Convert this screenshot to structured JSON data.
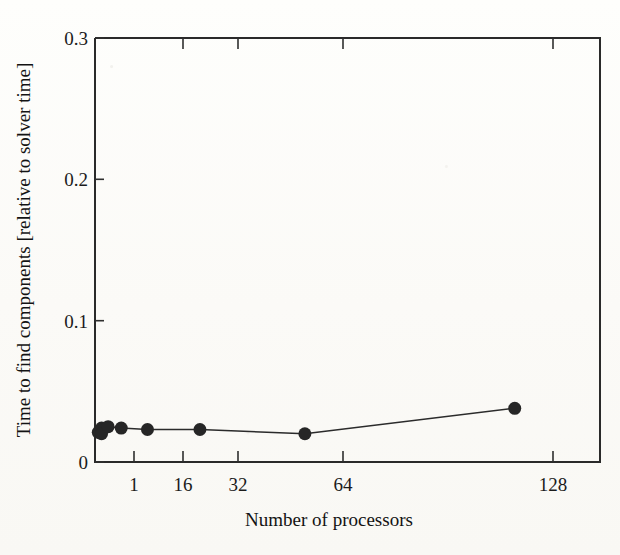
{
  "chart_data": {
    "type": "line",
    "title": "",
    "xlabel": "Number of processors",
    "ylabel": "Time to find components [relative to solver time]",
    "xlim": [
      0,
      154
    ],
    "ylim": [
      0,
      0.3
    ],
    "xticks": [
      1,
      16,
      32,
      64,
      128
    ],
    "xtick_labels": [
      "1",
      "16",
      "32",
      "64",
      "128"
    ],
    "yticks": [
      0,
      0.1,
      0.2,
      0.3
    ],
    "ytick_labels": [
      "0",
      "0.1",
      "0.2",
      "0.3"
    ],
    "grid": false,
    "legend": "none",
    "marker": "filled-circle",
    "marker_color": "#262626",
    "line_color": "#2b2b2b",
    "series": [
      {
        "name": "Time to find components",
        "x": [
          1,
          2,
          2,
          4,
          8,
          16,
          32,
          64,
          128
        ],
        "y": [
          0.021,
          0.024,
          0.02,
          0.025,
          0.024,
          0.023,
          0.023,
          0.02,
          0.038
        ]
      }
    ]
  },
  "axes": {
    "y_label": "Time to find components [relative to solver time]",
    "x_label": "Number of processors",
    "y_tick_0": "0",
    "y_tick_1": "0.1",
    "y_tick_2": "0.2",
    "y_tick_3": "0.3",
    "x_tick_0": "1",
    "x_tick_1": "16",
    "x_tick_2": "32",
    "x_tick_3": "64",
    "x_tick_4": "128"
  },
  "colors": {
    "ink": "#262626",
    "frame": "#2a2a2a",
    "paper": "#fdfdfb"
  }
}
